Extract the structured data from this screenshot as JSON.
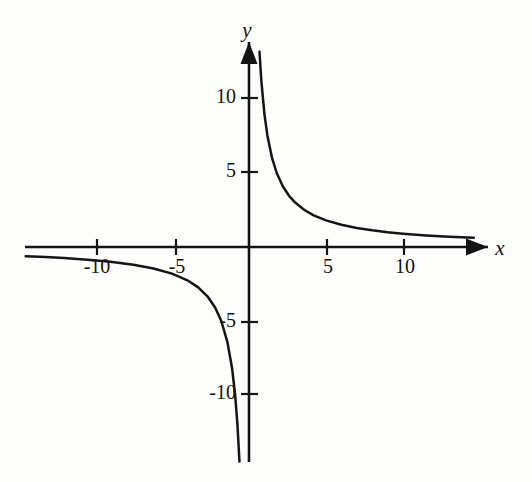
{
  "figure": {
    "background_color": "#fdfdfc",
    "ink_color": "#141414"
  },
  "chart_data": {
    "type": "line",
    "title": "",
    "subtitle": "",
    "xlabel": "x",
    "ylabel": "y",
    "equation": "y = 9/x",
    "grid": false,
    "legend": null,
    "xlim": [
      -14.5,
      15.5
    ],
    "ylim": [
      -14.5,
      14.0
    ],
    "xticks": [
      -10,
      -5,
      5,
      10
    ],
    "yticks": [
      -10,
      -5,
      5,
      10
    ],
    "xtick_labels": [
      "-10",
      "-5",
      "5",
      "10"
    ],
    "ytick_labels": [
      "-10",
      "-5",
      "5",
      "10"
    ],
    "axis_arrows": {
      "x_positive": true,
      "x_negative": false,
      "y_positive": true,
      "y_negative": false
    },
    "series": [
      {
        "name": "branch-quadrant-I",
        "x": [
          0.68,
          0.8,
          1.0,
          1.2,
          1.5,
          1.8,
          2.2,
          2.6,
          3.0,
          3.6,
          4.2,
          5.0,
          6.0,
          7.0,
          8.0,
          9.0,
          10.0,
          11.5,
          13.0,
          14.6
        ],
        "y": [
          13.2,
          11.25,
          9.0,
          7.5,
          6.0,
          5.0,
          4.09,
          3.46,
          3.0,
          2.5,
          2.14,
          1.8,
          1.5,
          1.29,
          1.13,
          1.0,
          0.9,
          0.78,
          0.69,
          0.62
        ]
      },
      {
        "name": "branch-quadrant-III",
        "x": [
          -0.62,
          -0.75,
          -0.9,
          -1.1,
          -1.4,
          -1.8,
          -2.2,
          -2.7,
          -3.3,
          -4.0,
          -5.0,
          -6.2,
          -7.5,
          -9.0,
          -10.5,
          -12.0,
          -13.2,
          -14.5
        ],
        "y": [
          -14.5,
          -12.0,
          -10.0,
          -8.18,
          -6.43,
          -5.0,
          -4.09,
          -3.33,
          -2.73,
          -2.25,
          -1.8,
          -1.45,
          -1.2,
          -1.0,
          -0.86,
          -0.75,
          -0.68,
          -0.62
        ]
      }
    ],
    "ticklabel_offsets": {
      "x_below_axis": true,
      "y_left_of_axis": true
    }
  },
  "axis_labels": {
    "x_label": "x",
    "y_label": "y"
  },
  "tick_text": {
    "x_neg_10": "-10",
    "x_neg_5": "-5",
    "x_pos_5": "5",
    "x_pos_10": "10",
    "y_neg_10": "-10",
    "y_neg_5": "-5",
    "y_pos_5": "5",
    "y_pos_10": "10"
  }
}
